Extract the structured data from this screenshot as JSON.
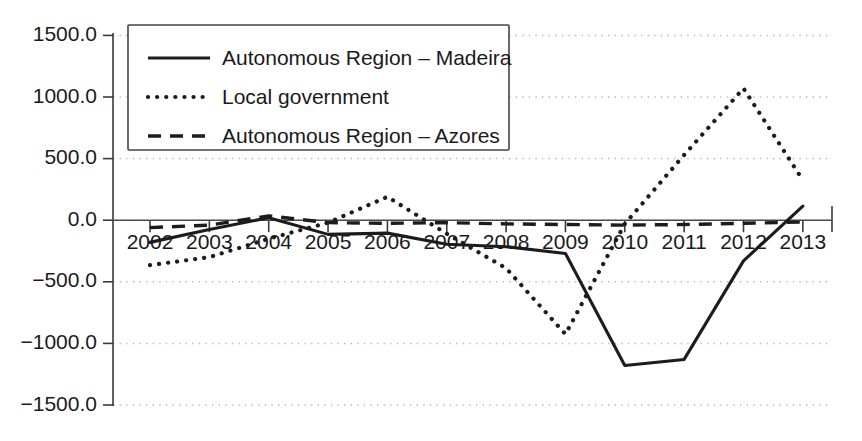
{
  "chart_data": {
    "type": "line",
    "title": "",
    "subtitle": "",
    "xlabel": "",
    "ylabel": "",
    "categories": [
      "2002",
      "2003",
      "2004",
      "2005",
      "2006",
      "2007",
      "2008",
      "2009",
      "2010",
      "2011",
      "2012",
      "2013"
    ],
    "xtick_labels": [
      "2002",
      "2003",
      "2004",
      "2005",
      "2006",
      "2007",
      "2008",
      "2009",
      "2010",
      "2011",
      "2012",
      "2013"
    ],
    "ytick_labels": [
      "1500.0",
      "1000.0",
      "500.0",
      "0.0",
      "-500.0",
      "-1000.0",
      "-1500.0"
    ],
    "ytick_values": [
      1500,
      1000,
      500,
      0,
      -500,
      -1000,
      -1500
    ],
    "ylim": [
      -1500,
      1500
    ],
    "grid": "horizontal-dotted",
    "legend_position": "top-left-inside",
    "series": [
      {
        "name": "Autonomous Region – Madeira",
        "style": "solid",
        "color": "#1c1c1c",
        "values": [
          -180,
          -75,
          20,
          -115,
          -105,
          -195,
          -215,
          -270,
          -1180,
          -1130,
          -330,
          115
        ]
      },
      {
        "name": "Local government",
        "style": "dotted",
        "color": "#1c1c1c",
        "values": [
          -365,
          -300,
          -150,
          -20,
          190,
          -110,
          -390,
          -925,
          -30,
          530,
          1070,
          325
        ]
      },
      {
        "name": "Autonomous Region – Azores",
        "style": "dashed",
        "color": "#1c1c1c",
        "values": [
          -60,
          -40,
          35,
          -20,
          -25,
          -20,
          -30,
          -35,
          -40,
          -35,
          -25,
          -15
        ]
      }
    ]
  },
  "legend": {
    "entries": [
      {
        "label": "Autonomous Region – Madeira",
        "style": "solid"
      },
      {
        "label": "Local government",
        "style": "dotted"
      },
      {
        "label": "Autonomous Region – Azores",
        "style": "dashed"
      }
    ]
  }
}
